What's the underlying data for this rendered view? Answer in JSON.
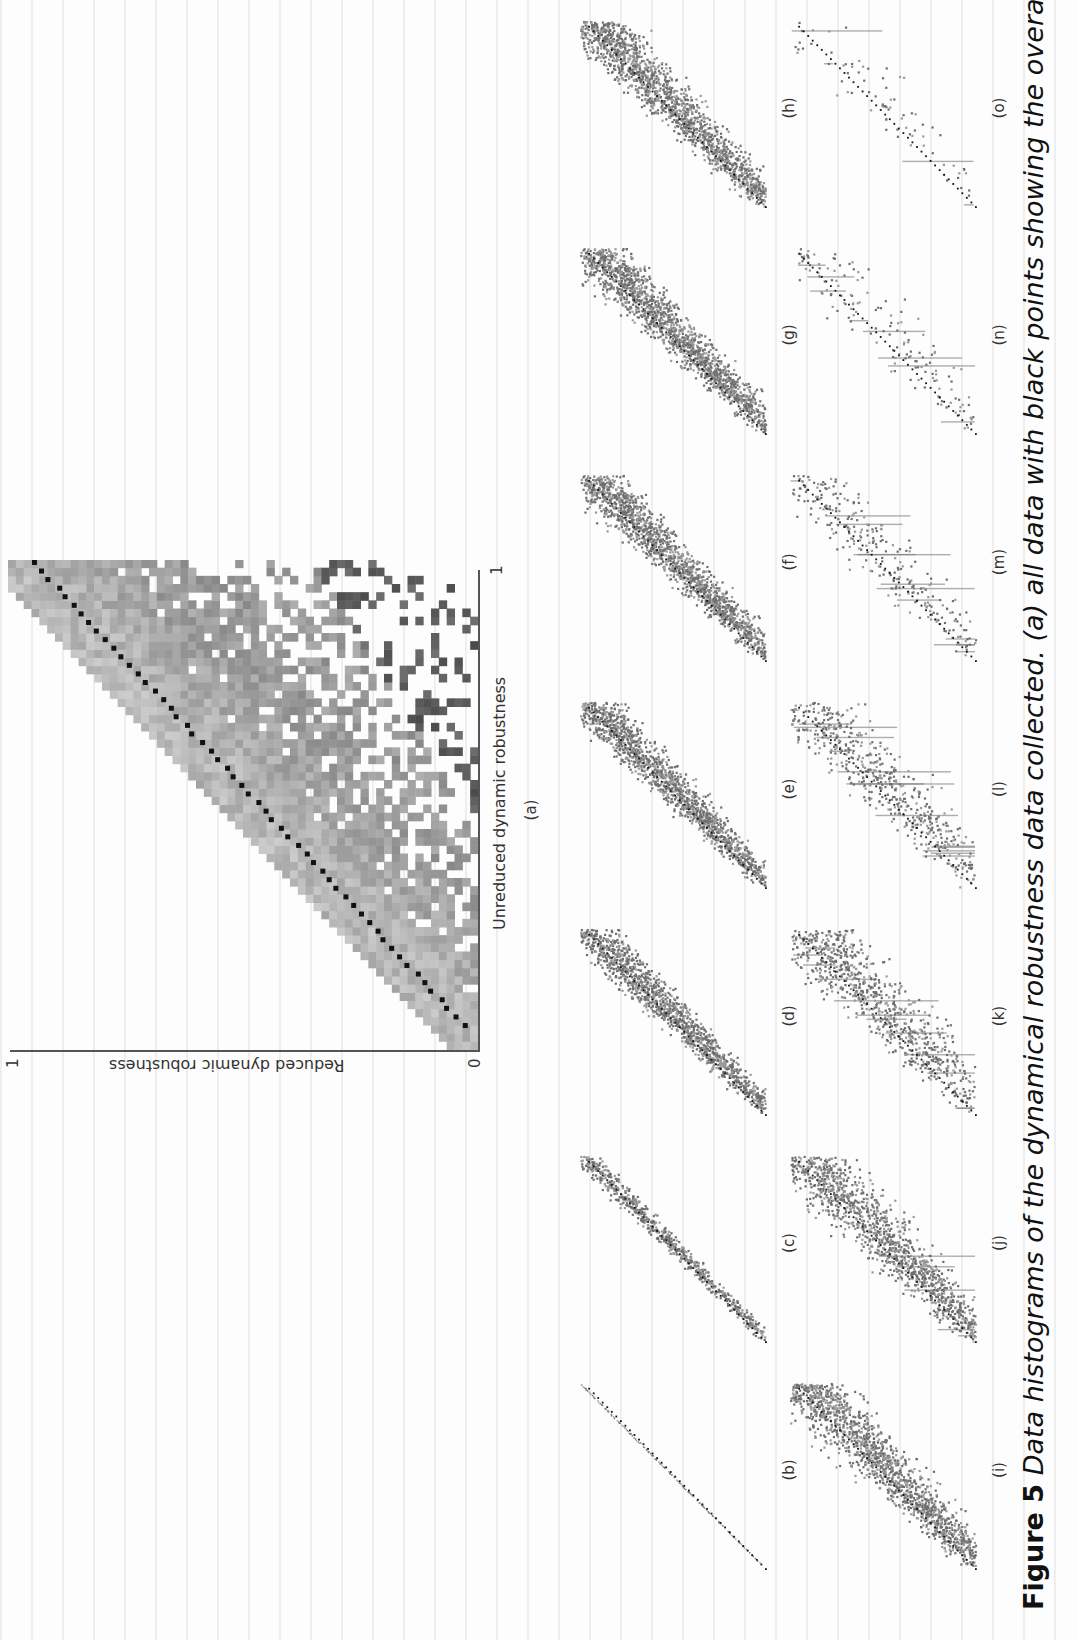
{
  "figure": {
    "number": "Figure 5",
    "caption_text": " Data histograms of the dynamical robustness data collected. (a) all data with black points showing the overall average"
  },
  "chart_data": [
    {
      "panel": "(a)",
      "type": "heatmap",
      "title": "",
      "xlabel": "Unreduced dynamic robustness",
      "ylabel": "Reduced dynamic robustness",
      "xlim": [
        0,
        1
      ],
      "ylim": [
        0,
        1
      ],
      "x_ticks": [
        "0",
        "1"
      ],
      "y_ticks": [
        "0",
        "1"
      ],
      "grid": false,
      "description": "2D histogram (grayscale, ~60x60 bins) of reduced vs unreduced dynamic robustness; dense band along the diagonal with spread below; black points show overall average, roughly following y = x",
      "average_series": {
        "x": [
          0.1,
          0.2,
          0.3,
          0.4,
          0.5,
          0.6,
          0.7,
          0.8,
          0.9,
          1.0
        ],
        "y": [
          0.08,
          0.16,
          0.26,
          0.36,
          0.46,
          0.56,
          0.66,
          0.76,
          0.88,
          0.98
        ]
      }
    },
    {
      "panel": "(b)",
      "type": "scatter",
      "xlim": [
        0,
        1
      ],
      "ylim": [
        0,
        1
      ],
      "description": "points tightly on diagonal line",
      "spread": 0.004,
      "density": 160
    },
    {
      "panel": "(c)",
      "type": "scatter",
      "xlim": [
        0,
        1
      ],
      "ylim": [
        0,
        1
      ],
      "description": "narrow band along diagonal",
      "spread": 0.06,
      "density": 700
    },
    {
      "panel": "(d)",
      "type": "scatter",
      "xlim": [
        0,
        1
      ],
      "ylim": [
        0,
        1
      ],
      "description": "band along diagonal with moderate spread",
      "spread": 0.12,
      "density": 1400
    },
    {
      "panel": "(e)",
      "type": "scatter",
      "xlim": [
        0,
        1
      ],
      "ylim": [
        0,
        1
      ],
      "description": "band along diagonal with moderate spread",
      "spread": 0.13,
      "density": 1500
    },
    {
      "panel": "(f)",
      "type": "scatter",
      "xlim": [
        0,
        1
      ],
      "ylim": [
        0,
        1
      ],
      "description": "band along diagonal with moderate spread",
      "spread": 0.14,
      "density": 1600
    },
    {
      "panel": "(g)",
      "type": "scatter",
      "xlim": [
        0,
        1
      ],
      "ylim": [
        0,
        1
      ],
      "description": "band along diagonal with wider spread",
      "spread": 0.15,
      "density": 1700
    },
    {
      "panel": "(h)",
      "type": "scatter",
      "xlim": [
        0,
        1
      ],
      "ylim": [
        0,
        1
      ],
      "description": "band along diagonal with wider spread",
      "spread": 0.16,
      "density": 1700
    },
    {
      "panel": "(i)",
      "type": "scatter",
      "xlim": [
        0,
        1
      ],
      "ylim": [
        0,
        1
      ],
      "description": "wide cloud around diagonal",
      "spread": 0.18,
      "density": 1500
    },
    {
      "panel": "(j)",
      "type": "scatter",
      "xlim": [
        0,
        1
      ],
      "ylim": [
        0,
        1
      ],
      "description": "wide cloud around diagonal with vertical streaks",
      "spread": 0.2,
      "density": 1300
    },
    {
      "panel": "(k)",
      "type": "scatter",
      "xlim": [
        0,
        1
      ],
      "ylim": [
        0,
        1
      ],
      "description": "sparse cloud with vertical streaks",
      "spread": 0.22,
      "density": 900
    },
    {
      "panel": "(l)",
      "type": "scatter",
      "xlim": [
        0,
        1
      ],
      "ylim": [
        0,
        1
      ],
      "description": "sparse points in vertical streaks",
      "spread": 0.22,
      "density": 600
    },
    {
      "panel": "(m)",
      "type": "scatter",
      "xlim": [
        0,
        1
      ],
      "ylim": [
        0,
        1
      ],
      "description": "few points in vertical streaks along diagonal",
      "spread": 0.2,
      "density": 300
    },
    {
      "panel": "(n)",
      "type": "scatter",
      "xlim": [
        0,
        1
      ],
      "ylim": [
        0,
        1
      ],
      "description": "very sparse vertical streaks with diagonal average",
      "spread": 0.2,
      "density": 160
    },
    {
      "panel": "(o)",
      "type": "scatter",
      "xlim": [
        0,
        1
      ],
      "ylim": [
        0,
        1
      ],
      "description": "very sparse points, few vertical lines",
      "spread": 0.2,
      "density": 80
    }
  ],
  "plot_a": {
    "label": "(a)",
    "xlabel": "Unreduced dynamic robustness",
    "ylabel": "Reduced dynamic robustness",
    "x_tick_0": "0",
    "x_tick_1": "1",
    "y_tick_0": "0",
    "y_tick_1": "1"
  },
  "row1": [
    {
      "label": "(b)",
      "seed": 2,
      "spread": 0.004,
      "n": 160,
      "streaks": 0,
      "line": 1
    },
    {
      "label": "(c)",
      "seed": 3,
      "spread": 0.06,
      "n": 700,
      "streaks": 0,
      "line": 0
    },
    {
      "label": "(d)",
      "seed": 4,
      "spread": 0.12,
      "n": 1400,
      "streaks": 0,
      "line": 0
    },
    {
      "label": "(e)",
      "seed": 5,
      "spread": 0.13,
      "n": 1500,
      "streaks": 0,
      "line": 0
    },
    {
      "label": "(f)",
      "seed": 6,
      "spread": 0.14,
      "n": 1600,
      "streaks": 0,
      "line": 0
    },
    {
      "label": "(g)",
      "seed": 7,
      "spread": 0.15,
      "n": 1700,
      "streaks": 0,
      "line": 0
    },
    {
      "label": "(h)",
      "seed": 8,
      "spread": 0.16,
      "n": 1700,
      "streaks": 0,
      "line": 0
    }
  ],
  "row2": [
    {
      "label": "(i)",
      "seed": 9,
      "spread": 0.18,
      "n": 1500,
      "streaks": 0,
      "line": 0
    },
    {
      "label": "(j)",
      "seed": 10,
      "spread": 0.2,
      "n": 1300,
      "streaks": 6,
      "line": 0
    },
    {
      "label": "(k)",
      "seed": 11,
      "spread": 0.22,
      "n": 900,
      "streaks": 12,
      "line": 0
    },
    {
      "label": "(l)",
      "seed": 12,
      "spread": 0.22,
      "n": 600,
      "streaks": 14,
      "line": 0
    },
    {
      "label": "(m)",
      "seed": 13,
      "spread": 0.2,
      "n": 300,
      "streaks": 12,
      "line": 0
    },
    {
      "label": "(n)",
      "seed": 14,
      "spread": 0.2,
      "n": 160,
      "streaks": 8,
      "line": 0
    },
    {
      "label": "(o)",
      "seed": 15,
      "spread": 0.2,
      "n": 80,
      "streaks": 4,
      "line": 0
    }
  ],
  "colors": {
    "ink": "#222222",
    "point_gray": "#6e6e6e",
    "band_gray": "#9a9a9a",
    "average_black": "#111111",
    "paper": "#fdfdfd"
  }
}
